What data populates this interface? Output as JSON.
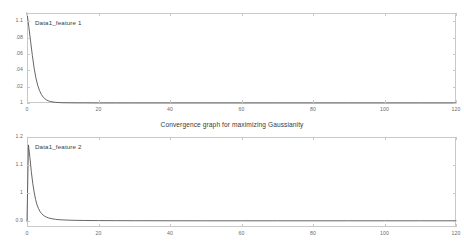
{
  "figure": {
    "caption": "Convergence graph for maximizing Gaussianity",
    "background_color": "#ffffff",
    "axis_color": "#c9c9c9",
    "line_color": "#555555",
    "text_color": "#4a4a4a"
  },
  "chart_data": [
    {
      "type": "line",
      "id": "feature-1",
      "title": "",
      "series_label": "Data1_feature 1",
      "xlabel": "",
      "ylabel": "",
      "xlim": [
        0,
        120
      ],
      "ylim": [
        1.0,
        1.11
      ],
      "xticks": [
        0,
        20,
        40,
        60,
        80,
        100,
        120
      ],
      "xticklabels": [
        "0",
        "20",
        "40",
        "60",
        "80",
        "100",
        "120"
      ],
      "yticks": [
        1.0,
        1.02,
        1.04,
        1.06,
        1.08,
        1.1
      ],
      "yticklabels": [
        "1",
        ".02",
        ".04",
        ".06",
        ".08",
        "1.1"
      ],
      "grid": false,
      "legend_position": "inside-top-left",
      "x": [
        0,
        0.5,
        1,
        1.5,
        2,
        2.5,
        3,
        3.5,
        4,
        4.5,
        5,
        5.5,
        6,
        6.5,
        7,
        8,
        9,
        10,
        12,
        14,
        16,
        20,
        25,
        30,
        40,
        50,
        60,
        70,
        80,
        90,
        100,
        110,
        120
      ],
      "values": [
        1.11,
        1.0935,
        1.0755,
        1.058,
        1.0425,
        1.0305,
        1.0215,
        1.0152,
        1.0106,
        1.0074,
        1.0052,
        1.0037,
        1.0026,
        1.0019,
        1.0014,
        1.0008,
        1.0005,
        1.0003,
        1.0002,
        1.0001,
        1.0001,
        1.0,
        1.0,
        1.0,
        1.0,
        1.0,
        1.0,
        1.0,
        1.0,
        1.0,
        1.0,
        1.0,
        1.0
      ]
    },
    {
      "type": "line",
      "id": "feature-2",
      "title": "",
      "series_label": "Data1_feature 2",
      "xlabel": "",
      "ylabel": "",
      "xlim": [
        0,
        120
      ],
      "ylim": [
        0.88,
        1.2
      ],
      "xticks": [
        0,
        20,
        40,
        60,
        80,
        100,
        120
      ],
      "xticklabels": [
        "0",
        "20",
        "40",
        "60",
        "80",
        "100",
        "120"
      ],
      "yticks": [
        0.9,
        1.0,
        1.1,
        1.2
      ],
      "yticklabels": [
        "0.9",
        "1",
        "1.1",
        "1.2"
      ],
      "grid": false,
      "legend_position": "inside-top-left",
      "x": [
        0,
        0.4,
        0.8,
        1.2,
        1.6,
        2,
        2.4,
        2.8,
        3.2,
        3.6,
        4,
        4.5,
        5,
        5.5,
        6,
        7,
        8,
        9,
        10,
        12,
        14,
        16,
        20,
        25,
        30,
        40,
        50,
        60,
        70,
        80,
        90,
        100,
        110,
        120
      ],
      "values": [
        0.9,
        1.172,
        1.128,
        1.078,
        1.036,
        1.004,
        0.978,
        0.959,
        0.946,
        0.936,
        0.929,
        0.9225,
        0.918,
        0.9148,
        0.9124,
        0.9092,
        0.9072,
        0.906,
        0.9052,
        0.9042,
        0.9036,
        0.9032,
        0.9028,
        0.9025,
        0.9023,
        0.9021,
        0.902,
        0.902,
        0.902,
        0.902,
        0.902,
        0.902,
        0.902,
        0.902
      ]
    }
  ]
}
